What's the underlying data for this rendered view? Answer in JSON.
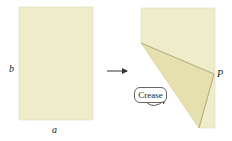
{
  "figure": {
    "left_panel": {
      "label_height": "b",
      "label_width": "a",
      "paper_color": "#efecc9"
    },
    "arrow": {
      "direction": "right"
    },
    "right_panel": {
      "point_label": "P",
      "callout": "Crease",
      "paper_color": "#efecc9",
      "fold_color": "#e6dfae"
    }
  }
}
